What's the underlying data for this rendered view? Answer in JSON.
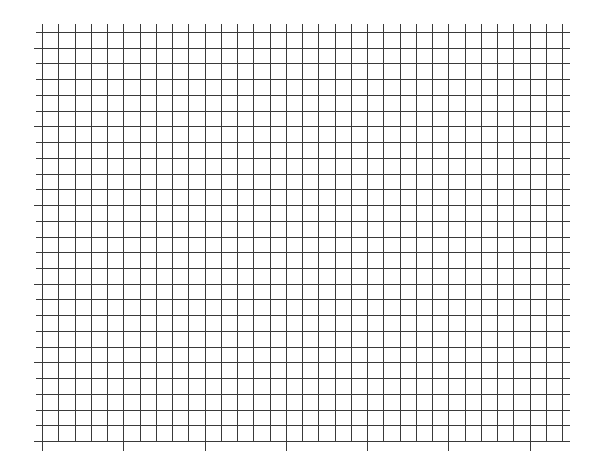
{
  "chart_data": {
    "type": "grid",
    "title": "",
    "xlabel": "",
    "ylabel": "",
    "x_cells": 32,
    "y_cells": 26,
    "x_major_every": 5,
    "y_major_every": 5,
    "x_tick_labels": [],
    "y_tick_labels": [],
    "grid": true,
    "series": []
  },
  "colors": {
    "grid_line": "#3a3a3a",
    "background": "#ffffff"
  }
}
